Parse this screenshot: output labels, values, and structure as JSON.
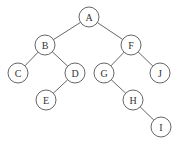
{
  "diagram": {
    "type": "binary-tree",
    "node_radius": 10,
    "colors": {
      "stroke": "#555555",
      "fill": "#ffffff",
      "text": "#333333"
    },
    "nodes": [
      {
        "id": "A",
        "label": "A",
        "x": 89,
        "y": 17
      },
      {
        "id": "B",
        "label": "B",
        "x": 45,
        "y": 45
      },
      {
        "id": "F",
        "label": "F",
        "x": 131,
        "y": 45
      },
      {
        "id": "C",
        "label": "C",
        "x": 18,
        "y": 73
      },
      {
        "id": "D",
        "label": "D",
        "x": 75,
        "y": 73
      },
      {
        "id": "G",
        "label": "G",
        "x": 104,
        "y": 73
      },
      {
        "id": "J",
        "label": "J",
        "x": 160,
        "y": 73
      },
      {
        "id": "E",
        "label": "E",
        "x": 46,
        "y": 100
      },
      {
        "id": "H",
        "label": "H",
        "x": 133,
        "y": 100
      },
      {
        "id": "I",
        "label": "I",
        "x": 161,
        "y": 127
      }
    ],
    "edges": [
      {
        "from": "A",
        "to": "B"
      },
      {
        "from": "A",
        "to": "F"
      },
      {
        "from": "B",
        "to": "C"
      },
      {
        "from": "B",
        "to": "D"
      },
      {
        "from": "D",
        "to": "E"
      },
      {
        "from": "F",
        "to": "G"
      },
      {
        "from": "F",
        "to": "J"
      },
      {
        "from": "G",
        "to": "H"
      },
      {
        "from": "H",
        "to": "I"
      }
    ]
  }
}
